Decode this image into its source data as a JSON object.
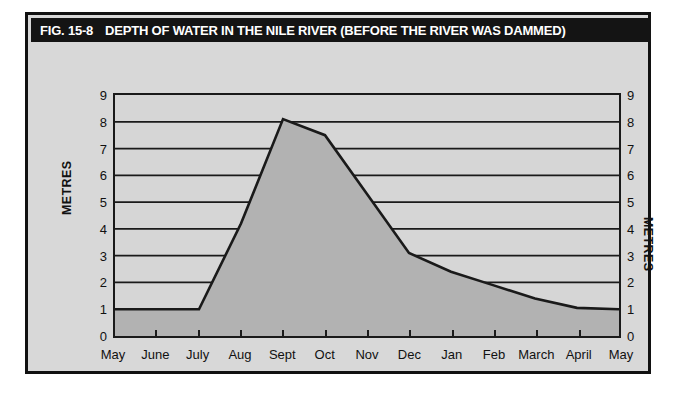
{
  "figure": {
    "label": "FIG. 15-8",
    "title": "DEPTH OF WATER IN THE NILE RIVER (BEFORE THE RIVER WAS DAMMED)"
  },
  "colors": {
    "title_bar": "#141414",
    "panel": "#d8d8d8",
    "plot_background": "#d6d6d6",
    "area_fill": "#b2b2b2",
    "line": "#1a1a1a",
    "frame": "#111111"
  },
  "chart_data": {
    "type": "area",
    "title": "DEPTH OF WATER IN THE NILE RIVER (BEFORE THE RIVER WAS DAMMED)",
    "xlabel": "",
    "ylabel": "METRES",
    "ylabel_right": "METRES",
    "categories": [
      "May",
      "June",
      "July",
      "Aug",
      "Sept",
      "Oct",
      "Nov",
      "Dec",
      "Jan",
      "Feb",
      "March",
      "April",
      "May"
    ],
    "values": [
      1.0,
      1.0,
      1.0,
      4.2,
      8.1,
      7.5,
      5.3,
      3.1,
      2.4,
      1.9,
      1.4,
      1.05,
      1.0
    ],
    "ylim": [
      0,
      9
    ],
    "yticks": [
      0,
      1,
      2,
      3,
      4,
      5,
      6,
      7,
      8,
      9
    ],
    "ytick_labels": [
      "0",
      "1",
      "2",
      "3",
      "4",
      "5",
      "6",
      "7",
      "8",
      "9"
    ],
    "grid": true,
    "legend": null,
    "series_name": "Depth of water"
  }
}
